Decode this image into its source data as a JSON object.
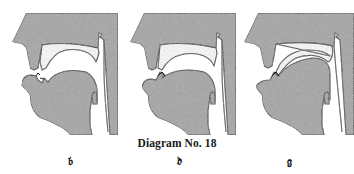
{
  "figure": {
    "caption": "Diagram No. 18",
    "fill_color": "#9a9a9a",
    "line_color": "#1a1a1a",
    "background": "#ffffff"
  },
  "panels": [
    {
      "id": "b",
      "label": "𝔟",
      "articulation": "lips closed, tongue low"
    },
    {
      "id": "d",
      "label": "𝔡",
      "articulation": "tongue tip against upper teeth ridge"
    },
    {
      "id": "g",
      "label": "𝔤",
      "articulation": "tongue back raised against soft palate"
    }
  ]
}
